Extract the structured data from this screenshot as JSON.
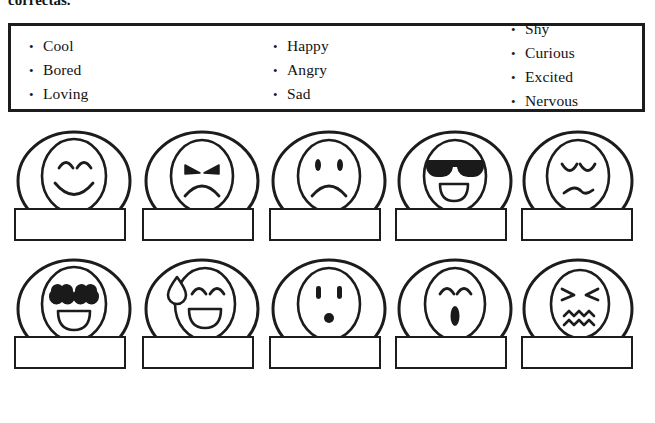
{
  "instruction": {
    "text": "correctas."
  },
  "word_bank": {
    "columns": [
      {
        "items": [
          "Cool",
          "Bored",
          "Loving"
        ]
      },
      {
        "items": [
          "Happy",
          "Angry",
          "Sad"
        ]
      },
      {
        "items": [
          "Shy",
          "Curious",
          "Excited",
          "Nervous"
        ]
      }
    ],
    "bullet": "•",
    "border_color": "#1c1c1c"
  },
  "faces": {
    "rows": [
      {
        "cells": [
          {
            "icon": "happy-face-icon",
            "answer": ""
          },
          {
            "icon": "angry-face-icon",
            "answer": ""
          },
          {
            "icon": "sad-face-icon",
            "answer": ""
          },
          {
            "icon": "cool-sunglasses-face-icon",
            "answer": ""
          },
          {
            "icon": "bored-face-icon",
            "answer": ""
          }
        ]
      },
      {
        "cells": [
          {
            "icon": "loving-heart-eyes-face-icon",
            "answer": ""
          },
          {
            "icon": "nervous-sweat-face-icon",
            "answer": ""
          },
          {
            "icon": "surprised-curious-face-icon",
            "answer": ""
          },
          {
            "icon": "excited-whistling-face-icon",
            "answer": ""
          },
          {
            "icon": "shy-scrunched-face-icon",
            "answer": ""
          }
        ]
      }
    ]
  },
  "colors": {
    "ink": "#1c1c1c",
    "paper": "#ffffff",
    "fill_dark": "#1a1a1a"
  }
}
